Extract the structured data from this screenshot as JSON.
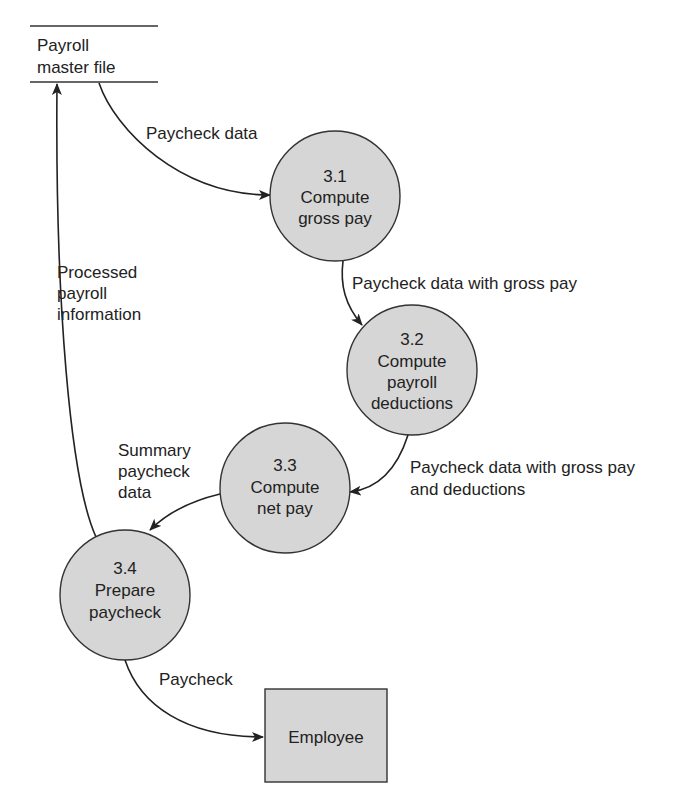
{
  "diagram": {
    "type": "data-flow-diagram",
    "data_store": {
      "lines": [
        "Payroll",
        "master file"
      ]
    },
    "processes": [
      {
        "id": "3.1",
        "lines": [
          "3.1",
          "Compute",
          "gross pay"
        ]
      },
      {
        "id": "3.2",
        "lines": [
          "3.2",
          "Compute",
          "payroll",
          "deductions"
        ]
      },
      {
        "id": "3.3",
        "lines": [
          "3.3",
          "Compute",
          "net pay"
        ]
      },
      {
        "id": "3.4",
        "lines": [
          "3.4",
          "Prepare",
          "paycheck"
        ]
      }
    ],
    "external_entity": {
      "label": "Employee"
    },
    "flows": [
      {
        "from": "Payroll master file",
        "to": "3.1",
        "lines": [
          "Paycheck data"
        ]
      },
      {
        "from": "3.1",
        "to": "3.2",
        "lines": [
          "Paycheck data with gross pay"
        ]
      },
      {
        "from": "3.2",
        "to": "3.3",
        "lines": [
          "Paycheck data with gross pay",
          "and deductions"
        ]
      },
      {
        "from": "3.3",
        "to": "3.4",
        "lines": [
          "Summary",
          "paycheck",
          "data"
        ]
      },
      {
        "from": "3.4",
        "to": "Payroll master file",
        "lines": [
          "Processed",
          "payroll",
          "information"
        ]
      },
      {
        "from": "3.4",
        "to": "Employee",
        "lines": [
          "Paycheck"
        ]
      }
    ],
    "colors": {
      "node_fill": "#d6d6d6",
      "stroke": "#333333",
      "text": "#222222",
      "background": "#ffffff"
    }
  }
}
